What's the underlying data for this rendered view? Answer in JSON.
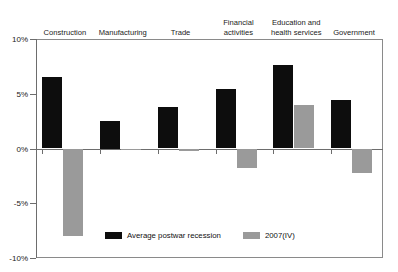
{
  "chart_data": {
    "type": "bar",
    "title": "",
    "subtitle": "",
    "xlabel": "",
    "ylabel": "",
    "ylim": [
      -10,
      10
    ],
    "ytick_values": [
      10,
      5,
      0,
      -5,
      -10
    ],
    "ytick_labels": [
      "10%",
      "5%",
      "0%",
      "-5%",
      "-10%"
    ],
    "grid": false,
    "legend_position": "bottom-center-inside",
    "categories": [
      "Construction",
      "Manufacturing",
      "Trade",
      "Financial\nactivities",
      "Education and\nhealth services",
      "Government"
    ],
    "series": [
      {
        "name": "Average postwar recession",
        "color": "#0d0d0d",
        "values": [
          6.5,
          2.5,
          3.8,
          5.4,
          7.6,
          4.4
        ]
      },
      {
        "name": "2007(IV)",
        "color": "#9a9a9a",
        "values": [
          -8.0,
          -0.1,
          -0.2,
          -1.8,
          4.0,
          -2.2
        ]
      }
    ]
  },
  "legend": {
    "items": [
      {
        "label": "Average postwar recession"
      },
      {
        "label": "2007(IV)"
      }
    ]
  }
}
